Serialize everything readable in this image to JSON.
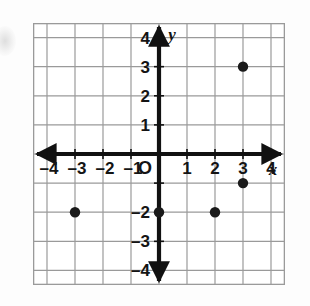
{
  "figure": {
    "kind": "coordinate-plane-scatter",
    "origin_label": "O",
    "x_axis_name": "x",
    "y_axis_name": "y"
  },
  "chart_data": {
    "type": "scatter",
    "title": "",
    "xlabel": "x",
    "ylabel": "y",
    "xlim": [
      -4.5,
      4.5
    ],
    "ylim": [
      -4.5,
      4.5
    ],
    "grid": true,
    "legend": "none",
    "x_ticks": [
      -4,
      -3,
      -2,
      -1,
      1,
      2,
      3,
      4
    ],
    "y_ticks": [
      4,
      3,
      2,
      1,
      -2,
      -3,
      -4
    ],
    "x_tick_labels": [
      "–4",
      "–3",
      "–2",
      "–1",
      "1",
      "2",
      "3",
      "4"
    ],
    "y_tick_labels": [
      "4",
      "3",
      "2",
      "1",
      "–2",
      "–3",
      "–4"
    ],
    "points": [
      {
        "x": 3,
        "y": 3
      },
      {
        "x": 3,
        "y": -1
      },
      {
        "x": 0,
        "y": -2
      },
      {
        "x": 2,
        "y": -2
      },
      {
        "x": -3,
        "y": -2
      }
    ],
    "point_color": "#1a1a1a",
    "axis_color": "#111111",
    "grid_color": "#9a9a9a"
  }
}
